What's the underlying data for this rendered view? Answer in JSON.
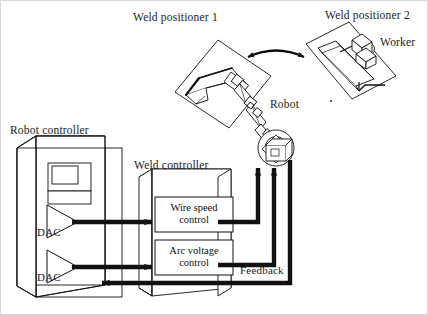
{
  "figure": {
    "background_color": "#ffffff",
    "line_color": "#111111",
    "border_color": "#cccccc",
    "width": 428,
    "height": 315
  },
  "labels": {
    "weld_positioner_1": "Weld positioner 1",
    "weld_positioner_2": "Weld positioner 2",
    "worker": "Worker",
    "robot": "Robot",
    "robot_controller": "Robot controller",
    "weld_controller": "Weld controller",
    "dac_upper": "DAC",
    "dac_lower": "DAC",
    "feedback": "Feedback"
  },
  "blocks": [
    {
      "id": "wire-speed-control",
      "line1": "Wire speed",
      "line2": "control"
    },
    {
      "id": "arc-voltage-control",
      "line1": "Arc voltage",
      "line2": "control"
    }
  ],
  "signals": [
    {
      "id": "dac-upper-to-wire-speed",
      "from": "DAC (upper)",
      "to": "Wire speed control",
      "direction": "forward"
    },
    {
      "id": "dac-lower-to-arc-voltage",
      "from": "DAC (lower)",
      "to": "Arc voltage control",
      "direction": "forward"
    },
    {
      "id": "wire-speed-to-robot",
      "from": "Wire speed control",
      "to": "Robot",
      "direction": "forward"
    },
    {
      "id": "arc-voltage-to-robot",
      "from": "Arc voltage control",
      "to": "Robot",
      "direction": "forward"
    },
    {
      "id": "robot-feedback-to-controller",
      "from": "Robot",
      "to": "Robot controller",
      "direction": "feedback",
      "label": "Feedback"
    },
    {
      "id": "positioner-swap-arc",
      "from": "Weld positioner 1",
      "to": "Weld positioner 2",
      "direction": "bidirectional"
    }
  ]
}
